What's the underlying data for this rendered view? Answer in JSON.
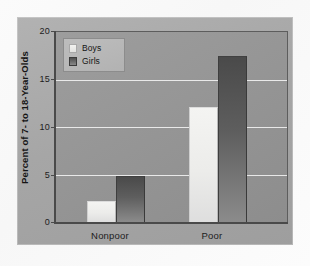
{
  "chart_data": {
    "type": "bar",
    "title": "",
    "subtitle": "",
    "xlabel": "",
    "ylabel": "Percent of 7- to 18-Year-Olds",
    "categories": [
      "Nonpoor",
      "Poor"
    ],
    "series": [
      {
        "name": "Boys",
        "values": [
          2.2,
          12.1
        ],
        "color": "#ececea"
      },
      {
        "name": "Girls",
        "values": [
          4.8,
          17.5
        ],
        "color": "#5e5e5e"
      }
    ],
    "ylim": [
      0,
      20
    ],
    "yticks": [
      0,
      5,
      10,
      15,
      20
    ],
    "ytick_labels": [
      "0",
      "5",
      "10",
      "15",
      "20"
    ],
    "grid": true,
    "gridline_values": [
      5,
      10,
      15
    ],
    "legend_position": "top-left",
    "legend_entries": [
      "Boys",
      "Girls"
    ]
  },
  "axes": {
    "y_title": "Percent of 7- to 18-Year-Olds",
    "y_ticks": [
      {
        "label": "20",
        "value": 20
      },
      {
        "label": "15",
        "value": 15
      },
      {
        "label": "10",
        "value": 10
      },
      {
        "label": "5",
        "value": 5
      },
      {
        "label": "0",
        "value": 0
      }
    ],
    "x_ticks": [
      {
        "label": "Nonpoor"
      },
      {
        "label": "Poor"
      }
    ]
  },
  "legend": {
    "items": [
      {
        "label": "Boys",
        "swatch": "boys-swatch"
      },
      {
        "label": "Girls",
        "swatch": "girls-swatch"
      }
    ]
  },
  "colors": {
    "page_background": "#fbfbfb",
    "panel_background": "#a6a6a6",
    "plot_background": "#959595",
    "gridline": "#f0f0f0",
    "axis": "#4a4a4a",
    "boys_bar": "#ececea",
    "girls_bar": "#5e5e5e",
    "text": "#1c1c1c"
  }
}
